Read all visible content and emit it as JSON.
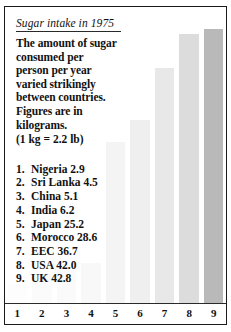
{
  "title": "Sugar intake in 1975",
  "paragraph_lines": [
    "The amount of sugar",
    "consumed per",
    "person per year",
    "varied strikingly",
    "between countries.",
    "Figures are in",
    "kilograms."
  ],
  "conversion_note": "(1 kg = 2.2 lb)",
  "countries": [
    {
      "rank": "1.",
      "name": "Nigeria",
      "value": "2.9"
    },
    {
      "rank": "2.",
      "name": "Sri Lanka",
      "value": "4.5"
    },
    {
      "rank": "3.",
      "name": "China",
      "value": "5.1"
    },
    {
      "rank": "4.",
      "name": "India",
      "value": "6.2"
    },
    {
      "rank": "5.",
      "name": "Japan",
      "value": "25.2"
    },
    {
      "rank": "6.",
      "name": "Morocco",
      "value": "28.6"
    },
    {
      "rank": "7.",
      "name": "EEC",
      "value": "36.7"
    },
    {
      "rank": "8.",
      "name": "USA",
      "value": "42.0"
    },
    {
      "rank": "9.",
      "name": "UK",
      "value": "42.8"
    }
  ],
  "axis_ticks": [
    "1",
    "2",
    "3",
    "4",
    "5",
    "6",
    "7",
    "8",
    "9"
  ],
  "chart_data": {
    "type": "bar",
    "title": "Sugar intake in 1975",
    "xlabel": "",
    "ylabel": "Sugar consumed per person per year (kg)",
    "categories": [
      "Nigeria",
      "Sri Lanka",
      "China",
      "India",
      "Japan",
      "Morocco",
      "EEC",
      "USA",
      "UK"
    ],
    "category_numbers": [
      1,
      2,
      3,
      4,
      5,
      6,
      7,
      8,
      9
    ],
    "values": [
      2.9,
      4.5,
      5.1,
      6.2,
      25.2,
      28.6,
      36.7,
      42.0,
      42.8
    ],
    "units": "kilograms",
    "ylim": [
      0,
      45
    ],
    "grid": false,
    "legend": "none",
    "bar_colors": [
      "#fdfdfd",
      "#fbfbfb",
      "#fafafa",
      "#f8f8f8",
      "#f4f4f4",
      "#efefef",
      "#e8e8e8",
      "#dcdcdc",
      "#b9b9b9"
    ],
    "annotation": "(1 kg = 2.2 lb)"
  }
}
